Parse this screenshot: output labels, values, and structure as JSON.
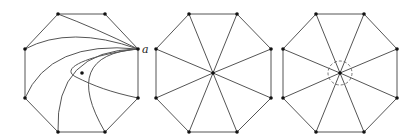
{
  "figure": {
    "panels": [
      {
        "id": "left",
        "description": "Octagon with curves from vertex a to other vertices, winding around an interior point",
        "vertex_label": "a",
        "vertices": [
          [
            58,
            14
          ],
          [
            105,
            14
          ],
          [
            138,
            49
          ],
          [
            138,
            98
          ],
          [
            105,
            132
          ],
          [
            58,
            132
          ],
          [
            25,
            98
          ],
          [
            25,
            49
          ]
        ],
        "interior_point": [
          82,
          73
        ]
      },
      {
        "id": "middle",
        "description": "Octagon with all vertices joined to the center point",
        "vertices": [
          [
            189,
            14
          ],
          [
            237,
            14
          ],
          [
            271,
            49
          ],
          [
            271,
            98
          ],
          [
            237,
            132
          ],
          [
            189,
            132
          ],
          [
            156,
            98
          ],
          [
            156,
            49
          ]
        ],
        "center": [
          213,
          73
        ]
      },
      {
        "id": "right",
        "description": "Octagon with spokes to center and a dashed circle around the center",
        "vertices": [
          [
            316,
            14
          ],
          [
            364,
            14
          ],
          [
            397,
            49
          ],
          [
            397,
            98
          ],
          [
            364,
            132
          ],
          [
            316,
            132
          ],
          [
            283,
            98
          ],
          [
            283,
            49
          ]
        ],
        "center": [
          340,
          73
        ],
        "dashed_circle_radius": 12
      }
    ]
  }
}
